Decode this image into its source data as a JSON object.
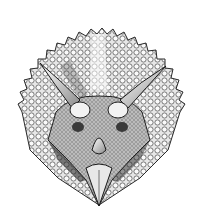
{
  "image": {
    "subject": "triceratops head illustration",
    "style": "black and white engraving",
    "colors": {
      "background": "#ffffff",
      "ink": "#1a1a1a",
      "shade": "#6b6b6b",
      "light": "#d9d9d9"
    }
  }
}
